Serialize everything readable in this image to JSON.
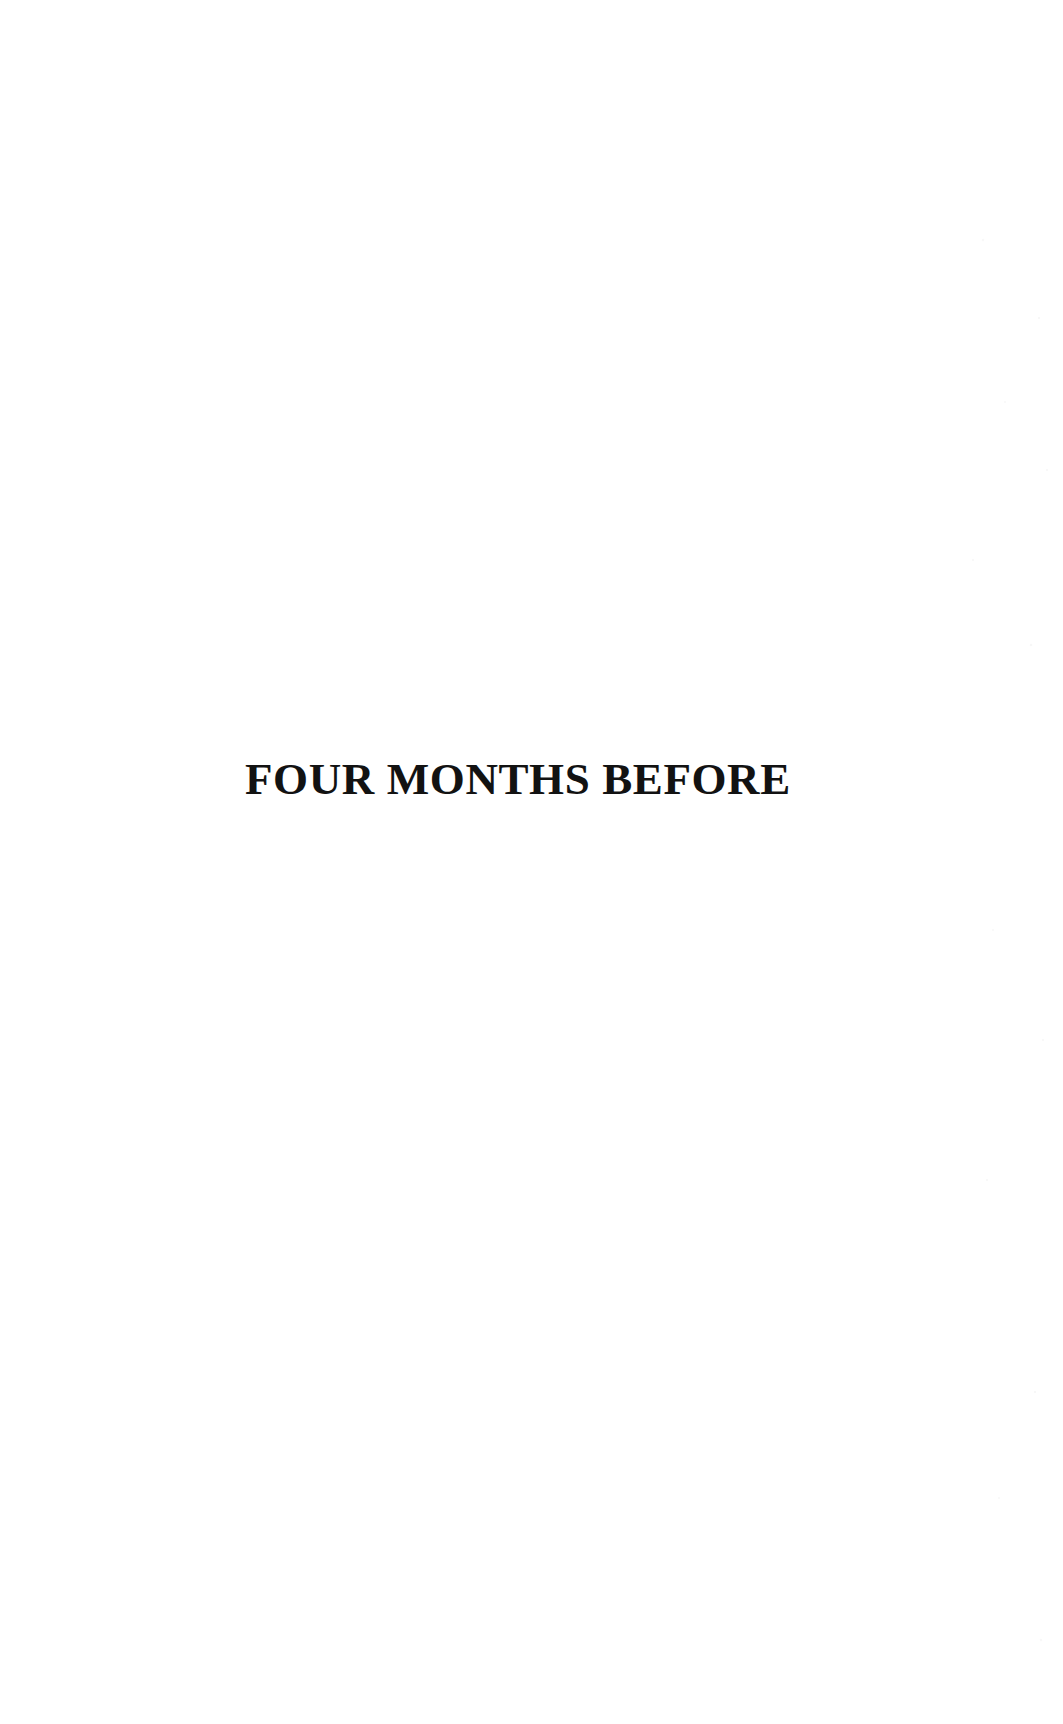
{
  "page": {
    "background_color": "#ffffff",
    "text_color": "#121212",
    "width": 1063,
    "height": 1724,
    "kind": "book-section-divider-page"
  },
  "body": {
    "section_title": "FOUR MONTHS BEFORE"
  }
}
